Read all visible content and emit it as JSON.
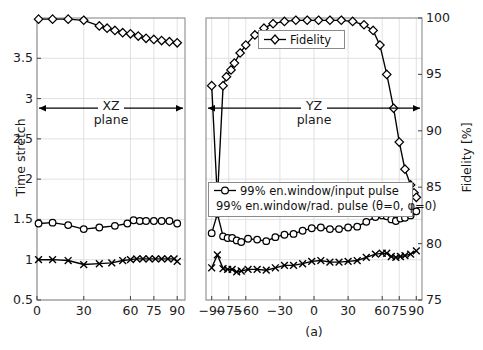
{
  "figure": {
    "caption": "(a)",
    "left_axis_label": "Time stretch",
    "right_axis_label": "Fidelity [%]",
    "annotations": [
      {
        "name": "xz-plane",
        "line1": "XZ",
        "line2": "plane"
      },
      {
        "name": "yz-plane",
        "line1": "YZ",
        "line2": "plane"
      }
    ]
  },
  "legends": {
    "fidelity": {
      "label": "Fidelity",
      "marker": "diamond-marker"
    },
    "pulses": [
      {
        "label": "99% en.window/input pulse",
        "marker": "circle-marker"
      },
      {
        "label": "99% en.window/rad. pulse (θ=0, φ=0)",
        "marker": "cross-marker"
      }
    ]
  },
  "chart_data": {
    "type": "line",
    "title": "",
    "xlabel": "",
    "ylabel": "Time stretch",
    "ylabel_right": "Fidelity [%]",
    "grid": true,
    "legend_position": "inside",
    "ylim": [
      0.5,
      4.0
    ],
    "yticks": [
      0.5,
      1,
      1.5,
      2,
      2.5,
      3,
      3.5
    ],
    "ylim_right": [
      75,
      100
    ],
    "yticks_right": [
      75,
      80,
      85,
      90,
      95,
      100
    ],
    "panels": [
      {
        "name": "XZ plane",
        "xlim": [
          0,
          95
        ],
        "xticks": [
          0,
          30,
          60,
          75,
          90
        ],
        "series": [
          {
            "name": "Fidelity",
            "axis": "right",
            "marker": "diamond",
            "x": [
              1,
              10,
              20,
              30,
              40,
              45,
              50,
              55,
              60,
              65,
              70,
              75,
              80,
              85,
              90
            ],
            "values": [
              99.9,
              99.9,
              99.9,
              99.8,
              99.3,
              99.1,
              98.9,
              98.7,
              98.6,
              98.4,
              98.2,
              98.1,
              98.0,
              97.9,
              97.8
            ]
          },
          {
            "name": "99% en.window/input pulse",
            "axis": "left",
            "marker": "circle",
            "x": [
              1,
              10,
              20,
              30,
              40,
              50,
              58,
              62,
              66,
              70,
              75,
              80,
              85,
              90
            ],
            "values": [
              1.45,
              1.46,
              1.43,
              1.38,
              1.4,
              1.42,
              1.45,
              1.49,
              1.48,
              1.48,
              1.48,
              1.48,
              1.48,
              1.45
            ]
          },
          {
            "name": "99% en.window/rad. pulse (θ=0, φ=0)",
            "axis": "left",
            "marker": "cross",
            "x": [
              1,
              10,
              20,
              30,
              40,
              48,
              55,
              60,
              64,
              68,
              72,
              76,
              80,
              84,
              88,
              90
            ],
            "values": [
              1.0,
              1.0,
              0.99,
              0.94,
              0.95,
              0.96,
              0.99,
              1.0,
              1.01,
              1.01,
              1.01,
              1.01,
              1.01,
              1.01,
              1.01,
              0.98
            ]
          }
        ]
      },
      {
        "name": "YZ plane",
        "xlim": [
          -95,
          95
        ],
        "xticks": [
          -90,
          -75,
          -60,
          -30,
          0,
          30,
          60,
          75,
          90
        ],
        "series": [
          {
            "name": "Fidelity",
            "axis": "right",
            "marker": "diamond",
            "x": [
              -90,
              -85,
              -80,
              -77,
              -73,
              -70,
              -65,
              -60,
              -52,
              -44,
              -36,
              -26,
              -16,
              -6,
              4,
              14,
              24,
              34,
              44,
              52,
              58,
              64,
              70,
              75,
              80,
              85,
              88,
              90
            ],
            "values": [
              94.0,
              84.0,
              94.0,
              94.8,
              95.4,
              96.0,
              96.9,
              97.6,
              98.5,
              99.1,
              99.5,
              99.7,
              99.8,
              99.8,
              99.8,
              99.8,
              99.8,
              99.7,
              99.4,
              98.9,
              97.6,
              95.0,
              92.0,
              89.0,
              86.6,
              85.2,
              84.5,
              84.1
            ]
          },
          {
            "name": "99% en.window/input pulse",
            "axis": "left",
            "marker": "circle",
            "x": [
              -90,
              -85,
              -80,
              -76,
              -72,
              -68,
              -64,
              -58,
              -50,
              -42,
              -34,
              -26,
              -18,
              -10,
              -2,
              6,
              14,
              22,
              30,
              38,
              46,
              54,
              60,
              64,
              68,
              72,
              76,
              80,
              85,
              90
            ],
            "values": [
              1.33,
              1.57,
              1.29,
              1.27,
              1.27,
              1.24,
              1.22,
              1.26,
              1.25,
              1.23,
              1.28,
              1.31,
              1.32,
              1.36,
              1.39,
              1.4,
              1.38,
              1.38,
              1.4,
              1.41,
              1.47,
              1.53,
              1.55,
              1.54,
              1.5,
              1.48,
              1.51,
              1.52,
              1.55,
              1.6
            ]
          },
          {
            "name": "99% en.window/rad. pulse (θ=0, φ=0)",
            "axis": "left",
            "marker": "cross",
            "x": [
              -90,
              -85,
              -80,
              -76,
              -72,
              -68,
              -64,
              -58,
              -50,
              -42,
              -34,
              -26,
              -18,
              -10,
              -2,
              6,
              14,
              22,
              30,
              38,
              46,
              54,
              60,
              64,
              68,
              72,
              76,
              80,
              85,
              90
            ],
            "values": [
              0.9,
              1.06,
              0.89,
              0.88,
              0.88,
              0.85,
              0.86,
              0.88,
              0.88,
              0.87,
              0.9,
              0.93,
              0.93,
              0.95,
              0.98,
              0.99,
              0.97,
              0.97,
              0.98,
              0.99,
              1.03,
              1.07,
              1.08,
              1.08,
              1.04,
              1.03,
              1.04,
              1.05,
              1.07,
              1.11
            ]
          }
        ]
      }
    ]
  }
}
